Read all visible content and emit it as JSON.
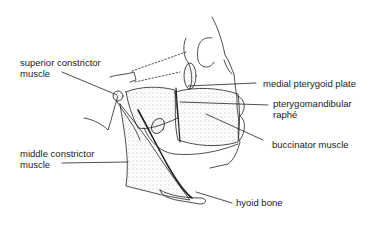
{
  "diagram": {
    "type": "anatomical-illustration",
    "labels": [
      {
        "id": "superior-constrictor",
        "lines": [
          "superior constrictor",
          "muscle"
        ]
      },
      {
        "id": "medial-pterygoid-plate",
        "lines": [
          "medial pterygoid plate"
        ]
      },
      {
        "id": "pterygomandibular-raphe",
        "lines": [
          "pterygomandibular",
          "raphé"
        ]
      },
      {
        "id": "buccinator",
        "lines": [
          "buccinator muscle"
        ]
      },
      {
        "id": "middle-constrictor",
        "lines": [
          "middle constrictor",
          "muscle"
        ]
      },
      {
        "id": "hyoid-bone",
        "lines": [
          "hyoid bone"
        ]
      }
    ]
  }
}
